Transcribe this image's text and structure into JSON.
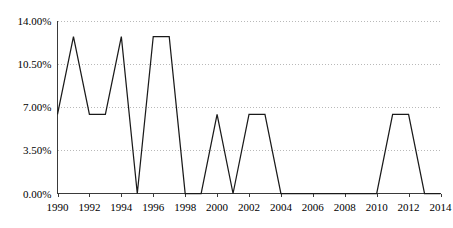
{
  "chart_data": {
    "type": "line",
    "title": "",
    "subtitle": "",
    "xlabel": "",
    "ylabel": "",
    "xlim": [
      1990,
      2014
    ],
    "ylim": [
      0,
      14
    ],
    "ytick_values": [
      0,
      3.5,
      7,
      10.5,
      14
    ],
    "ytick_labels": [
      "0.00%",
      "3.50%",
      "7.00%",
      "10.50%",
      "14.00%"
    ],
    "xtick_values": [
      1990,
      1992,
      1994,
      1996,
      1998,
      2000,
      2002,
      2004,
      2006,
      2008,
      2010,
      2012,
      2014
    ],
    "xtick_labels": [
      "1990",
      "1992",
      "1994",
      "1996",
      "1998",
      "2000",
      "2002",
      "2004",
      "2006",
      "2008",
      "2010",
      "2012",
      "2014"
    ],
    "grid": "horizontal-dotted",
    "legend": "none",
    "series": [
      {
        "name": "series-1",
        "x": [
          1990,
          1991,
          1992,
          1993,
          1994,
          1995,
          1996,
          1997,
          1998,
          1999,
          2000,
          2001,
          2002,
          2003,
          2004,
          2005,
          2006,
          2007,
          2008,
          2009,
          2010,
          2011,
          2012,
          2013,
          2014
        ],
        "values": [
          6.4,
          12.7,
          6.4,
          6.4,
          12.7,
          0,
          12.7,
          12.7,
          0,
          0,
          6.4,
          0,
          6.4,
          6.4,
          0,
          0,
          0,
          0,
          0,
          0,
          0,
          6.4,
          6.4,
          0,
          0
        ],
        "color": "#1a1a1a"
      }
    ],
    "colors": {
      "line": "#1a1a1a",
      "grid": "#b9b9b9",
      "axis": "#3a3a3a",
      "background": "#ffffff",
      "text": "#000000"
    }
  }
}
